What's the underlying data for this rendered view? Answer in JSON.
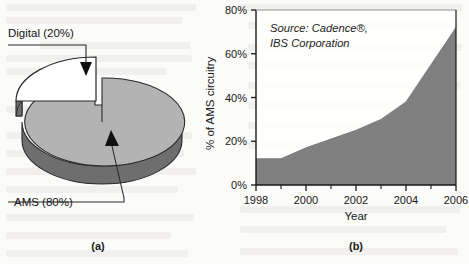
{
  "figure": {
    "panel_a": {
      "caption": "(a)",
      "labels": {
        "digital": "Digital (20%)",
        "ams": "AMS (80%)"
      }
    },
    "panel_b": {
      "caption": "(b)",
      "source_line_1": "Source: Cadence®,",
      "source_line_2": "IBS Corporation"
    }
  },
  "colors": {
    "fill_gray": "#808080",
    "pie_top_gray": "#b3b3b3",
    "pie_side_gray": "#6e6e6e",
    "pie_digital_white": "#ffffff",
    "axis_black": "#1a1a1a"
  },
  "chart_data": [
    {
      "type": "pie",
      "title": "",
      "slices": [
        {
          "label": "Digital (20%)",
          "name": "Digital",
          "value": 20,
          "color": "#ffffff",
          "exploded": true
        },
        {
          "label": "AMS (80%)",
          "name": "AMS",
          "value": 80,
          "color": "#b3b3b3",
          "exploded": false
        }
      ],
      "units": "%",
      "legend": "none",
      "annotations": [
        "Digital (20%)",
        "AMS (80%)"
      ]
    },
    {
      "type": "area",
      "title": "",
      "xlabel": "Year",
      "ylabel": "% of AMS circuitry",
      "xlim": [
        1998,
        2006
      ],
      "ylim": [
        0,
        80
      ],
      "grid": false,
      "legend": "none",
      "annotations": [
        "Source: Cadence®,",
        "IBS Corporation"
      ],
      "y_ticks": [
        0,
        20,
        40,
        60,
        80
      ],
      "y_tick_labels": [
        "0%",
        "20%",
        "40%",
        "60%",
        "80%"
      ],
      "x_ticks": [
        1998,
        2000,
        2002,
        2004,
        2006
      ],
      "x_tick_labels": [
        "1998",
        "2000",
        "2002",
        "2004",
        "2006"
      ],
      "x_minor_ticks": [
        1999,
        2001,
        2003,
        2005
      ],
      "x": [
        1998,
        1999,
        2000,
        2001,
        2002,
        2003,
        2004,
        2005,
        2006
      ],
      "values": [
        12,
        12,
        17,
        21,
        25,
        30,
        38,
        55,
        72
      ],
      "series": [
        {
          "name": "% of AMS circuitry",
          "values": [
            12,
            12,
            17,
            21,
            25,
            30,
            38,
            55,
            72
          ]
        }
      ]
    }
  ]
}
